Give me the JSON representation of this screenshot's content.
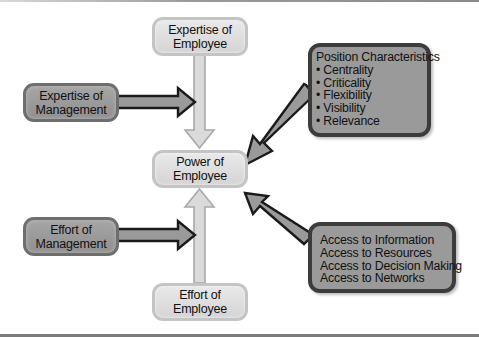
{
  "diagram": {
    "nodes": {
      "expertise_employee": {
        "line1": "Expertise of",
        "line2": "Employee"
      },
      "expertise_management": {
        "line1": "Expertise of",
        "line2": "Management"
      },
      "power_employee": {
        "line1": "Power of",
        "line2": "Employee"
      },
      "effort_management": {
        "line1": "Effort of",
        "line2": "Management"
      },
      "effort_employee": {
        "line1": "Effort of",
        "line2": "Employee"
      },
      "position_characteristics": {
        "title": "Position Characteristics",
        "items": [
          "Centrality",
          "Criticality",
          "Flexibility",
          "Visibility",
          "Relevance"
        ]
      },
      "access": {
        "items": [
          "Access to Information",
          "Access to Resources",
          "Access to Decision Making",
          "Access to Networks"
        ]
      }
    },
    "edges": [
      {
        "from": "Expertise of Employee",
        "to": "Power of Employee"
      },
      {
        "from": "Expertise of Management",
        "to": "Expertise of Employee → Power of Employee arrow"
      },
      {
        "from": "Position Characteristics",
        "to": "Power of Employee"
      },
      {
        "from": "Access to Information / Resources / Decision Making / Networks",
        "to": "Power of Employee"
      },
      {
        "from": "Effort of Employee",
        "to": "Power of Employee"
      },
      {
        "from": "Effort of Management",
        "to": "Effort of Employee → Power of Employee arrow"
      }
    ],
    "colors": {
      "light_box": "#dcdcdc",
      "dark_box": "#999999",
      "arrow_dark_outline": "#1a1a1a",
      "arrow_fill": "#9b9b9b",
      "light_arrow_fill": "#d9d9d9",
      "light_arrow_outline": "#a9a9a9"
    }
  }
}
